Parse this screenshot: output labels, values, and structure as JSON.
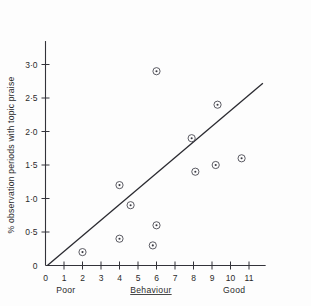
{
  "chart_data": {
    "type": "scatter",
    "title": "",
    "subtitle": "",
    "xlabel": "Behaviour",
    "ylabel": "% observation periods with topic praise",
    "xlim": [
      0,
      11.9
    ],
    "ylim": [
      0,
      3.35
    ],
    "grid": false,
    "legend": null,
    "x_tick_labels": [
      "0",
      "1",
      "2",
      "3",
      "4",
      "5",
      "6",
      "7",
      "8",
      "9",
      "10",
      "11"
    ],
    "x_tick_values": [
      0,
      1,
      2,
      3,
      4,
      5,
      6,
      7,
      8,
      9,
      10,
      11
    ],
    "y_tick_labels": [
      "0",
      "0·5",
      "1·0",
      "1·5",
      "2·0",
      "2·5",
      "3·0"
    ],
    "y_tick_values": [
      0,
      0.5,
      1.0,
      1.5,
      2.0,
      2.5,
      3.0
    ],
    "x_axis_anchors": {
      "left_label": "Poor",
      "center_label": "Behaviour",
      "right_label": "Good"
    },
    "points": [
      {
        "x": 2.0,
        "y": 0.2
      },
      {
        "x": 4.0,
        "y": 0.4
      },
      {
        "x": 4.0,
        "y": 1.2
      },
      {
        "x": 4.6,
        "y": 0.9
      },
      {
        "x": 5.8,
        "y": 0.3
      },
      {
        "x": 6.0,
        "y": 0.6
      },
      {
        "x": 6.0,
        "y": 2.9
      },
      {
        "x": 7.9,
        "y": 1.9
      },
      {
        "x": 8.1,
        "y": 1.4
      },
      {
        "x": 9.2,
        "y": 1.5
      },
      {
        "x": 9.3,
        "y": 2.4
      },
      {
        "x": 10.6,
        "y": 1.6
      }
    ],
    "fit_line": {
      "x_start": 0.1,
      "y_start": 0.0,
      "x_end": 11.75,
      "y_end": 2.72,
      "style": "solid"
    },
    "colors": {
      "axis": "#33333a",
      "marker_stroke": "#4a4a52",
      "marker_fill": "#3a3a42",
      "fit_line": "#2a2a30",
      "text": "#2b2b2b",
      "background": "#fdfdfd"
    }
  }
}
